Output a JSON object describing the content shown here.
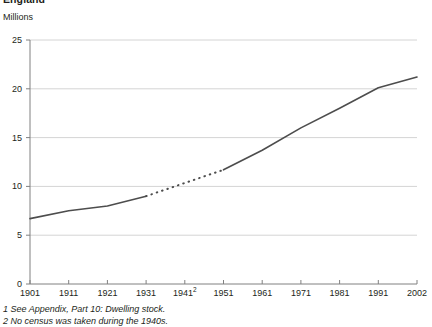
{
  "chart_data": {
    "type": "line",
    "title": "England",
    "subtitle": "Millions",
    "ylabel": "Millions",
    "xlabel": "",
    "ylim": [
      0,
      25
    ],
    "yticks": [
      0,
      5,
      10,
      15,
      20,
      25
    ],
    "ytick_labels": [
      "0",
      "5",
      "10",
      "15",
      "20",
      "25"
    ],
    "xlim": [
      1901,
      2002
    ],
    "xticks": [
      1901,
      1911,
      1921,
      1931,
      1941,
      1951,
      1961,
      1971,
      1981,
      1991,
      2002
    ],
    "xtick_labels": [
      "1901",
      "1911",
      "1921",
      "1931",
      "1941",
      "1951",
      "1961",
      "1971",
      "1981",
      "1991",
      "2002"
    ],
    "xtick_superscripts": [
      "",
      "",
      "",
      "",
      "2",
      "",
      "",
      "",
      "",
      "",
      ""
    ],
    "grid": "horizontal",
    "legend": "none",
    "line_color": "#4d4d4d",
    "series": [
      {
        "name": "Dwelling stock",
        "style": "solid",
        "x": [
          1901,
          1911,
          1921,
          1931
        ],
        "values": [
          6.7,
          7.5,
          8.0,
          9.0
        ]
      },
      {
        "name": "Dwelling stock (estimated, war years)",
        "style": "dotted",
        "x": [
          1931,
          1951
        ],
        "values": [
          9.0,
          11.7
        ]
      },
      {
        "name": "Dwelling stock",
        "style": "solid",
        "x": [
          1951,
          1961,
          1971,
          1981,
          1991,
          2002
        ],
        "values": [
          11.7,
          13.7,
          16.0,
          18.0,
          20.1,
          21.2
        ]
      }
    ]
  },
  "footnotes": [
    "1 See Appendix, Part 10: Dwelling stock.",
    "2 No census was taken during the 1940s."
  ]
}
